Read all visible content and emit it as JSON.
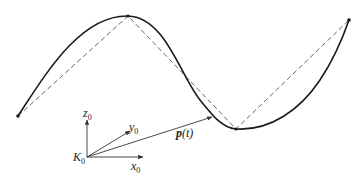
{
  "diagram": {
    "title": "",
    "frame": {
      "origin_label": "K",
      "origin_sub": "0",
      "axes": [
        {
          "name": "x",
          "sub": "0"
        },
        {
          "name": "y",
          "sub": "0"
        },
        {
          "name": "z",
          "sub": "0"
        }
      ]
    },
    "position_vector": {
      "label_main": "p",
      "label_arg": "(t)"
    },
    "curve": {
      "type": "smooth spline",
      "control_points": [
        [
          18,
          116
        ],
        [
          128,
          16
        ],
        [
          236,
          129
        ],
        [
          349,
          20
        ]
      ]
    },
    "colors": {
      "curve": "#1a1a1a",
      "dashed_polygon": "#555555",
      "axes": "#333333",
      "background": "#ffffff"
    }
  }
}
